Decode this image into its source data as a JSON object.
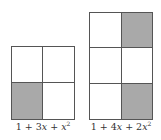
{
  "figures": [
    {
      "label_parts": [
        "1 + 3",
        "x",
        " + ",
        "x",
        "2"
      ],
      "label": "1 + 3x + x^2",
      "grid": {
        "rows": 2,
        "cols": 2,
        "shaded": [
          [
            1,
            0
          ]
        ]
      }
    },
    {
      "label_parts": [
        "1 + 4",
        "x",
        " + 2",
        "x",
        "2"
      ],
      "label": "1 + 4x + 2x^2",
      "grid": {
        "rows": 3,
        "cols": 2,
        "shaded": [
          [
            0,
            1
          ],
          [
            2,
            1
          ]
        ]
      }
    }
  ],
  "colors": {
    "shade": "#a9a9a9",
    "line": "#555555"
  }
}
